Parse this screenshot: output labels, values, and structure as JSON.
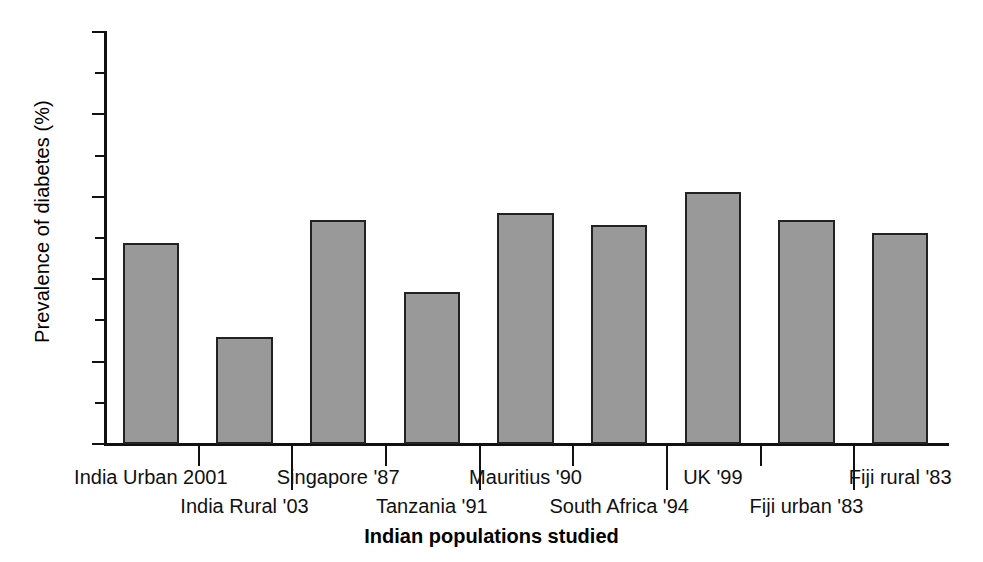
{
  "chart_data": {
    "type": "bar",
    "title": "",
    "xlabel": "Indian populations studied",
    "ylabel": "Prevalence of diabetes (%)",
    "ylim": [
      0,
      25
    ],
    "ytick_labels": [
      "0",
      "5",
      "10",
      "15",
      "20",
      "25"
    ],
    "ytick_values": [
      0,
      5,
      10,
      15,
      20,
      25
    ],
    "yminor_values": [
      2.5,
      7.5,
      12.5,
      17.5,
      22.5
    ],
    "grid": false,
    "legend": "none",
    "bar_fill_color": "#999999",
    "bar_edge_color": "#222222",
    "axis_color": "#111111",
    "categories": [
      "India Urban 2001",
      "India Rural '03",
      "Singapore '87",
      "Tanzania '91",
      "Mauritius '90",
      "South Africa '94",
      "UK '99",
      "Fiji urban '83",
      "Fiji rural '83"
    ],
    "values": [
      12.2,
      6.5,
      13.6,
      9.2,
      14.0,
      13.3,
      15.3,
      13.6,
      12.8
    ],
    "label_rows": [
      "a",
      "b",
      "a",
      "b",
      "a",
      "b",
      "a",
      "b",
      "a"
    ]
  }
}
